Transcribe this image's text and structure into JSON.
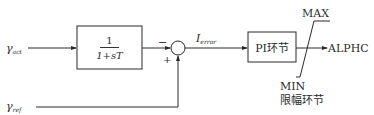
{
  "diagram": {
    "inputs": {
      "gamma_act": {
        "symbol": "γ",
        "subscript": "act"
      },
      "gamma_ref": {
        "symbol": "γ",
        "subscript": "ref"
      }
    },
    "filter_block": {
      "numerator": "1",
      "denominator": "1+sT"
    },
    "summing_junction": {
      "minus_sign": "−",
      "plus_sign": "+"
    },
    "error_signal": {
      "symbol": "I",
      "subscript": "error"
    },
    "pi_block": {
      "label": "PI环节"
    },
    "limiter": {
      "max_label": "MAX",
      "min_label": "MIN",
      "name": "限幅环节"
    },
    "output": {
      "label": "ALPHC"
    },
    "colors": {
      "line": "#2a2a2a",
      "background": "#ffffff"
    }
  }
}
